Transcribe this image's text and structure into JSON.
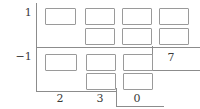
{
  "diagram": {
    "type": "long-division-box-grid-worksheet",
    "ink_color": "#3a3a3a",
    "line_color": "#8c8c8c",
    "box_border_color": "#9a9a9a",
    "background_color": "#ffffff",
    "row_labels": [
      {
        "id": "row-top",
        "text": "1"
      },
      {
        "id": "row-bottom",
        "text": "−1"
      }
    ],
    "column_labels": [
      {
        "id": "col-1",
        "text": "2"
      },
      {
        "id": "col-2",
        "text": "3"
      },
      {
        "id": "col-3",
        "text": "0"
      }
    ],
    "side_labels": [
      {
        "id": "side-right",
        "text": "7"
      }
    ],
    "boxes": {
      "count": 14,
      "fill": "",
      "top_section": [
        {
          "id": "box-t1-c1",
          "x": 45,
          "y": 8,
          "w": 31,
          "h": 17
        },
        {
          "id": "box-t1-c2",
          "x": 85,
          "y": 8,
          "w": 30,
          "h": 17
        },
        {
          "id": "box-t1-c3",
          "x": 122,
          "y": 8,
          "w": 30,
          "h": 17
        },
        {
          "id": "box-t1-c4",
          "x": 159,
          "y": 8,
          "w": 30,
          "h": 17
        },
        {
          "id": "box-t2-c2",
          "x": 85,
          "y": 28,
          "w": 30,
          "h": 17
        },
        {
          "id": "box-t2-c3",
          "x": 122,
          "y": 28,
          "w": 30,
          "h": 17
        },
        {
          "id": "box-t2-c4",
          "x": 159,
          "y": 28,
          "w": 30,
          "h": 17
        }
      ],
      "bottom_section": [
        {
          "id": "box-b1-c1",
          "x": 45,
          "y": 54,
          "w": 32,
          "h": 17
        },
        {
          "id": "box-b1-c2",
          "x": 86,
          "y": 54,
          "w": 30,
          "h": 17
        },
        {
          "id": "box-b1-c3",
          "x": 123,
          "y": 54,
          "w": 30,
          "h": 17
        },
        {
          "id": "box-b2-c2",
          "x": 86,
          "y": 73,
          "w": 30,
          "h": 17
        },
        {
          "id": "box-b2-c3",
          "x": 123,
          "y": 73,
          "w": 30,
          "h": 17
        }
      ]
    },
    "rules": {
      "top_vertical": {
        "x": 36,
        "y": 3,
        "h": 44
      },
      "top_horizontal": {
        "x": 36,
        "y": 47,
        "w": 164
      },
      "bottom_vertical": {
        "x": 36,
        "y": 48,
        "h": 43
      },
      "bottom_horizontal": {
        "x": 36,
        "y": 91,
        "w": 80
      },
      "side_vertical": {
        "x": 152,
        "y": 46,
        "h": 24
      },
      "side_horizontal": {
        "x": 152,
        "y": 70,
        "w": 48
      },
      "quotient_vertical": {
        "x": 116,
        "y": 88,
        "h": 18
      },
      "quotient_horizontal": {
        "x": 116,
        "y": 106,
        "w": 48
      }
    }
  }
}
